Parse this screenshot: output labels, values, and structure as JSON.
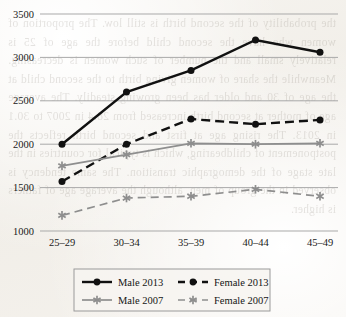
{
  "page": {
    "background_color": "#f4f2ee",
    "bleed_through_text": "the probability of the second birth is still low. The proportion of women who have the second child before the age of 25 is relatively small and the number of such women is decreasing. Meanwhile the share of women giving birth to the second child at the age of 30 and older has been growing steadily. The average age of mother at second birth increased from 28.4 in 2007 to 30.1 in 2013. The rising age at first and second birth reflects the postponement of childbearing, which is typical for countries in the late stage of the demographic transition. The same tendency is observed in the group of men, although the average age of fathers is higher.",
    "ink_color": "#111111",
    "grid_color": "#a9a9a9",
    "secondary_series_color": "#8e8e8e"
  },
  "chart_data": {
    "type": "line",
    "title": "",
    "subtitle": "",
    "xlabel": "",
    "ylabel": "",
    "categories": [
      "25–29",
      "30–34",
      "35–39",
      "40–44",
      "45–49"
    ],
    "yticks": [
      1000,
      1500,
      2000,
      2500,
      3000,
      3500
    ],
    "ytick_labels": [
      "1000",
      "1500",
      "2000",
      "2500",
      "3000",
      "3500"
    ],
    "ylim": [
      1000,
      3500
    ],
    "grid": "horizontal",
    "legend_position": "bottom-center",
    "series": [
      {
        "name": "Male 2013",
        "values": [
          2000,
          2600,
          2850,
          3200,
          3060
        ],
        "color": "#111111",
        "linestyle": "solid",
        "marker": "circle",
        "linewidth": 2.4
      },
      {
        "name": "Female 2013",
        "values": [
          1570,
          2000,
          2290,
          2230,
          2280
        ],
        "color": "#111111",
        "linestyle": "dashed",
        "marker": "circle",
        "linewidth": 2.4
      },
      {
        "name": "Male 2007",
        "values": [
          1750,
          1880,
          2010,
          2000,
          2010
        ],
        "color": "#8e8e8e",
        "linestyle": "solid",
        "marker": "star",
        "linewidth": 1.7
      },
      {
        "name": "Female 2007",
        "values": [
          1180,
          1380,
          1400,
          1480,
          1400
        ],
        "color": "#8e8e8e",
        "linestyle": "dashed",
        "marker": "star",
        "linewidth": 1.7
      }
    ],
    "legend": [
      {
        "label": "Male 2013",
        "marker": "circle",
        "linestyle": "solid",
        "color": "#111111"
      },
      {
        "label": "Female 2013",
        "marker": "circle",
        "linestyle": "dashed",
        "color": "#111111"
      },
      {
        "label": "Male 2007",
        "marker": "star",
        "linestyle": "solid",
        "color": "#8e8e8e"
      },
      {
        "label": "Female 2007",
        "marker": "star",
        "linestyle": "dashed",
        "color": "#8e8e8e"
      }
    ]
  }
}
